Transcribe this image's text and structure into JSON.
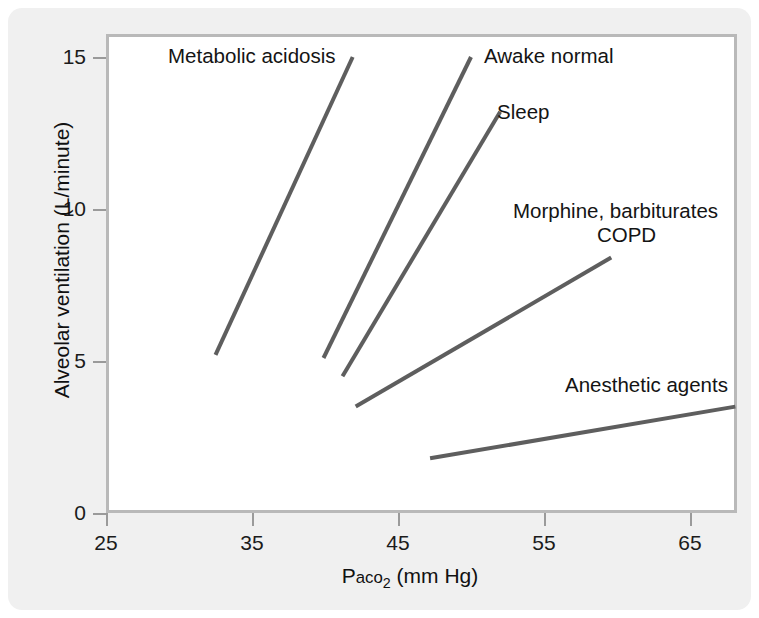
{
  "chart_data": {
    "type": "line",
    "title": "",
    "subtitle": "",
    "xlabel_parts": {
      "prefix": "P",
      "smallcaps": "aco",
      "sub": "2",
      "suffix": " (mm Hg)"
    },
    "xlabel": "Paco2 (mm Hg)",
    "ylabel": "Alveolar ventilation (L/minute)",
    "xlim": [
      25,
      70
    ],
    "ylim": [
      0,
      15.8
    ],
    "xticks": [
      25,
      35,
      45,
      55,
      65
    ],
    "yticks": [
      0,
      5,
      10,
      15
    ],
    "xtick_labels": [
      "25",
      "35",
      "45",
      "55",
      "65"
    ],
    "ytick_labels": [
      "0",
      "5",
      "10",
      "15"
    ],
    "grid": false,
    "legend_position": "inline-annotations",
    "line_color": "#5e5e5e",
    "line_width": 4,
    "axis_color": "#b9b9b9",
    "background": "#f0f0f0",
    "plot_background": "#ffffff",
    "series": [
      {
        "name": "Metabolic acidosis",
        "x": [
          32.5,
          41.9
        ],
        "y": [
          5.2,
          15.0
        ],
        "label": "Metabolic acidosis",
        "label_x": 36.0,
        "label_y": 15.0
      },
      {
        "name": "Awake normal",
        "x": [
          39.9,
          50.0
        ],
        "y": [
          5.1,
          15.0
        ],
        "label": "Awake normal",
        "label_x": 56.4,
        "label_y": 15.0
      },
      {
        "name": "Sleep",
        "x": [
          41.2,
          52.0
        ],
        "y": [
          4.5,
          13.2
        ],
        "label": "Sleep",
        "label_x": 54.0,
        "label_y": 13.6
      },
      {
        "name": "Morphine, barbiturates / COPD",
        "x": [
          42.1,
          59.6
        ],
        "y": [
          3.5,
          8.4
        ],
        "label": "Morphine, barbiturates",
        "label2": "COPD",
        "label_x": 60.0,
        "label_y": 10.0
      },
      {
        "name": "Anesthetic agents",
        "x": [
          47.2,
          68.1
        ],
        "y": [
          1.8,
          3.5
        ],
        "label": "Anesthetic agents",
        "label_x": 63.5,
        "label_y": 4.0
      }
    ]
  },
  "axes": {
    "ytick_labels": [
      "15",
      "10",
      "5",
      "0"
    ],
    "xtick_labels": [
      "25",
      "35",
      "45",
      "55",
      "65"
    ],
    "ylabel": "Alveolar ventilation (L/minute)",
    "xlabel_prefix": "P",
    "xlabel_smallcaps": "aco",
    "xlabel_sub": "2",
    "xlabel_suffix": " (mm Hg)"
  },
  "annotations": {
    "metabolic_acidosis": "Metabolic acidosis",
    "awake_normal": "Awake normal",
    "sleep": "Sleep",
    "morphine": "Morphine, barbiturates",
    "copd": "COPD",
    "anesthetic": "Anesthetic agents"
  }
}
